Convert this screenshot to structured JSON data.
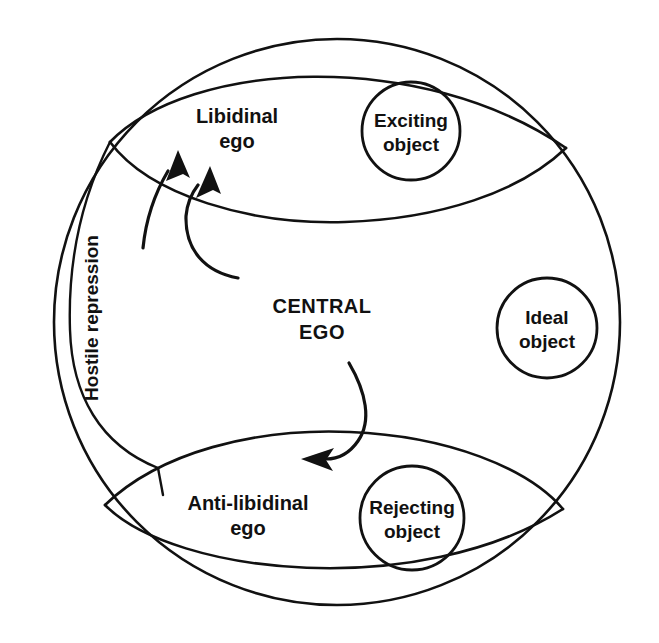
{
  "figure": {
    "background_color": "#ffffff",
    "ink_color": "#111111",
    "width": 659,
    "height": 643
  },
  "regions": {
    "central_ego": {
      "name": "central-ego",
      "label_line1": "CENTRAL",
      "label_line2": "EGO"
    },
    "libidinal_ego": {
      "name": "libidinal-ego",
      "label_line1": "Libidinal",
      "label_line2": "ego"
    },
    "antilibidinal_ego": {
      "name": "anti-libidinal-ego",
      "label_line1": "Anti-libidinal",
      "label_line2": "ego"
    },
    "hostile_repression_band": {
      "name": "hostile-repression-band",
      "label": "Hostile repression",
      "orientation": "vertical-bottom-to-top"
    }
  },
  "objects": [
    {
      "name": "exciting-object",
      "label_line1": "Exciting",
      "label_line2": "object",
      "cx": 411,
      "cy": 131,
      "r": 49
    },
    {
      "name": "ideal-object",
      "label_line1": "Ideal",
      "label_line2": "object",
      "cx": 547,
      "cy": 328,
      "r": 50
    },
    {
      "name": "rejecting-object",
      "label_line1": "Rejecting",
      "label_line2": "object",
      "cx": 412,
      "cy": 518,
      "r": 52
    }
  ],
  "arrows": [
    {
      "name": "repression-arrow-outer",
      "description": "from hostile repression band toward libidinal ego"
    },
    {
      "name": "repression-arrow-inner",
      "description": "from central ego curving up toward libidinal ego"
    },
    {
      "name": "aggression-arrow",
      "description": "from central ego curving down toward anti-libidinal ego"
    }
  ]
}
